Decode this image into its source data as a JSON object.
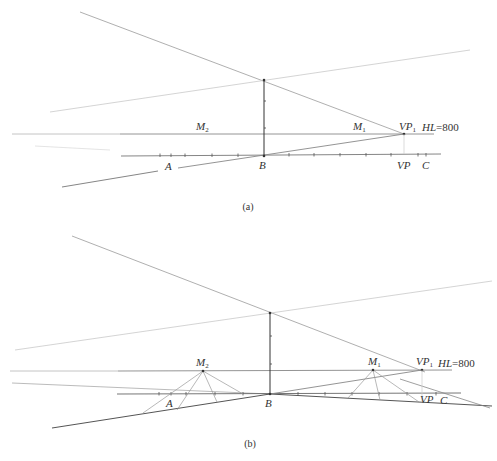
{
  "figure": {
    "panels": [
      {
        "id": "a",
        "caption": "(a)",
        "labels": {
          "M2": {
            "base": "M",
            "sub": "2"
          },
          "M1": {
            "base": "M",
            "sub": "1"
          },
          "VP1": {
            "base": "VP",
            "sub": "1"
          },
          "HL": {
            "base": "HL",
            "value": "=800"
          },
          "A": "A",
          "B": "B",
          "VP": "VP",
          "C": "C"
        }
      },
      {
        "id": "b",
        "caption": "(b)",
        "labels": {
          "M2": {
            "base": "M",
            "sub": "2"
          },
          "M1": {
            "base": "M",
            "sub": "1"
          },
          "VP1": {
            "base": "VP",
            "sub": "1"
          },
          "HL": {
            "base": "HL",
            "value": "=800"
          },
          "A": "A",
          "B": "B",
          "VP": "VP",
          "C": "C"
        }
      }
    ],
    "colors": {
      "line_dark": "#444444",
      "line_mid": "#8a8a8a",
      "line_light": "#c4c4c4",
      "text": "#333333"
    }
  }
}
